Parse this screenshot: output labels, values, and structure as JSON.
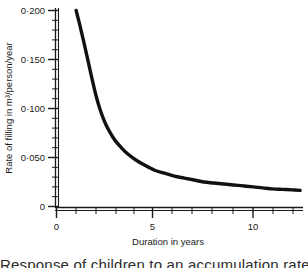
{
  "chart_data": {
    "type": "line",
    "title": "",
    "xlabel": "Duration in years",
    "ylabel": "Rate of filling in m³/person/year",
    "xlim": [
      0,
      12.6
    ],
    "ylim": [
      0,
      0.2
    ],
    "grid": false,
    "legend": null,
    "x_ticks_major": [
      0,
      5,
      10
    ],
    "x_tick_labels_major": [
      "0",
      "5",
      "10"
    ],
    "x_ticks_minor": [
      1,
      2,
      3,
      4,
      6,
      7,
      8,
      9,
      11,
      12
    ],
    "y_ticks_major": [
      0,
      0.05,
      0.1,
      0.15,
      0.2
    ],
    "y_tick_labels_major": [
      "0",
      "0·050",
      "0·100",
      "0·150",
      "0·200"
    ],
    "y_ticks_minor": [
      0.01,
      0.02,
      0.03,
      0.04,
      0.06,
      0.07,
      0.08,
      0.09,
      0.11,
      0.12,
      0.13,
      0.14,
      0.16,
      0.17,
      0.18,
      0.19
    ],
    "series": [
      {
        "name": "Rate of filling",
        "line_color": "#111111",
        "line_width": 3.4,
        "x": [
          1.0,
          1.2,
          1.4,
          1.6,
          1.8,
          2.0,
          2.2,
          2.4,
          2.6,
          2.8,
          3.0,
          3.3,
          3.6,
          4.0,
          4.5,
          5.0,
          5.5,
          6.0,
          6.5,
          7.0,
          7.5,
          8.0,
          8.5,
          9.0,
          9.5,
          10.0,
          10.5,
          11.0,
          11.5,
          12.0,
          12.4
        ],
        "y": [
          0.2,
          0.184,
          0.167,
          0.149,
          0.131,
          0.114,
          0.1,
          0.089,
          0.08,
          0.073,
          0.067,
          0.06,
          0.054,
          0.048,
          0.042,
          0.037,
          0.034,
          0.031,
          0.029,
          0.027,
          0.025,
          0.024,
          0.023,
          0.022,
          0.021,
          0.02,
          0.019,
          0.018,
          0.0175,
          0.017,
          0.0165
        ]
      }
    ]
  },
  "caption": {
    "clipped_text": "Response of children to an accumulation rate"
  },
  "axis_style": {
    "line_color": "#1a1a1a",
    "background": "#ffffff"
  }
}
